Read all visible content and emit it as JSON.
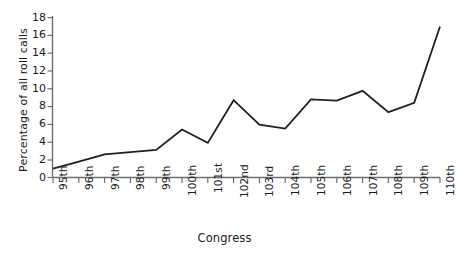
{
  "chart_data": {
    "type": "line",
    "title": "",
    "xlabel": "Congress",
    "ylabel": "Percentage of all roll calls",
    "categories": [
      "95th",
      "96th",
      "97th",
      "98th",
      "99th",
      "100th",
      "101st",
      "102nd",
      "103rd",
      "104th",
      "105th",
      "106th",
      "107th",
      "108th",
      "109th",
      "110th"
    ],
    "values": [
      1.0,
      1.8,
      2.6,
      2.85,
      3.1,
      5.4,
      3.9,
      8.7,
      5.95,
      5.5,
      8.8,
      8.65,
      9.75,
      7.35,
      8.4,
      17.0
    ],
    "series": [
      {
        "name": "Percentage of all roll calls",
        "values": [
          1.0,
          1.8,
          2.6,
          2.85,
          3.1,
          5.4,
          3.9,
          8.7,
          5.95,
          5.5,
          8.8,
          8.65,
          9.75,
          7.35,
          8.4,
          17.0
        ]
      }
    ],
    "ylim": [
      0,
      18
    ],
    "yticks": [
      0,
      2,
      4,
      6,
      8,
      10,
      12,
      14,
      16,
      18
    ],
    "ytick_labels": [
      "0",
      "2",
      "4",
      "6",
      "8",
      "10",
      "12",
      "14",
      "16",
      "18"
    ],
    "grid": false,
    "legend": false,
    "legend_position": "none",
    "line_color": "#231f20",
    "axis_color": "#6d6e70",
    "background_color": "#ffffff"
  }
}
